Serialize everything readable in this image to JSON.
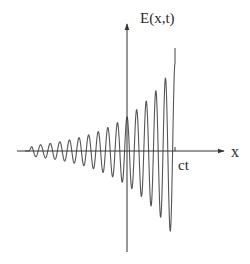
{
  "diagram": {
    "type": "wave-packet",
    "y_axis_label": "E(x,t)",
    "x_axis_label": "x",
    "front_label": "ct",
    "colors": {
      "axis": "#333333",
      "wave": "#555555",
      "text": "#2b2b2b",
      "background": "#ffffff"
    },
    "geometry": {
      "origin_x": 127,
      "axis_y": 151,
      "x_axis_start": 17,
      "x_axis_end": 224,
      "y_axis_top": 24,
      "y_axis_bottom": 252,
      "wave_start_x": 29,
      "wave_end_x": 175,
      "front_top_y": 48,
      "period_px": 9.6
    }
  }
}
